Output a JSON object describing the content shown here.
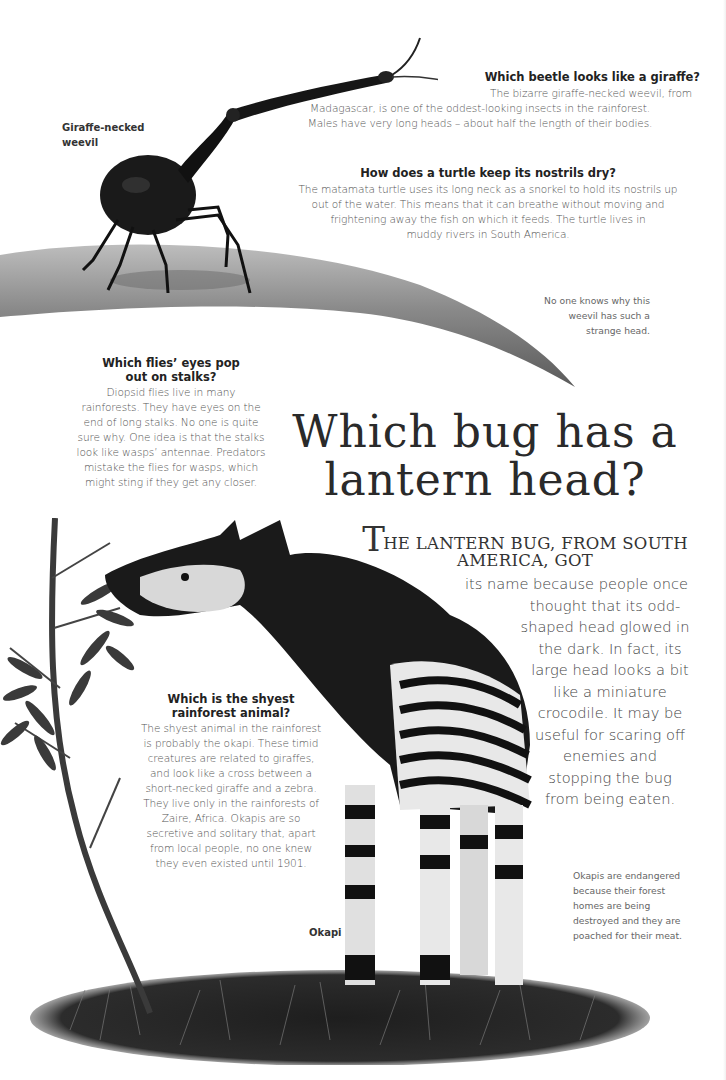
{
  "weevil_section": {
    "label": [
      "Giraffe-necked",
      "weevil"
    ],
    "question": "Which beetle looks like a giraffe?",
    "body_lines": [
      "The bizarre giraffe-necked weevil, from",
      "Madagascar, is one of the oddest-looking insects in the rainforest.",
      "Males have very long heads – about half the length of their bodies."
    ],
    "caption_lines": [
      "No one knows why this",
      "weevil has such a",
      "strange head."
    ]
  },
  "turtle_section": {
    "question": "How does a turtle keep its nostrils dry?",
    "body_lines": [
      "The matamata turtle uses its long neck as a snorkel to hold its nostrils up",
      "out of the water. This means that it can breathe without moving and",
      "frightening away the fish on which it feeds. The turtle lives in",
      "muddy rivers in South America."
    ]
  },
  "flies_section": {
    "question_lines": [
      "Which flies’ eyes pop",
      "out on stalks?"
    ],
    "body_lines": [
      "Diopsid flies live in many",
      "rainforests. They have eyes on the",
      "end of long stalks. No one is quite",
      "sure why. One idea is that the stalks",
      "look like wasps’ antennae. Predators",
      "mistake the flies for wasps, which",
      "might sting if they get any closer."
    ]
  },
  "main_feature": {
    "title_lines": [
      "Which bug has a",
      "lantern head?"
    ],
    "lead_dropcap": "T",
    "lead_lines": [
      "HE LANTERN BUG, FROM SOUTH",
      "AMERICA, GOT"
    ],
    "body_lines": [
      "its name because people once",
      "thought that its odd-",
      "shaped head glowed in",
      "the dark. In fact, its",
      "large head looks a bit",
      "like a miniature",
      "crocodile. It may be",
      "useful for scaring off",
      "enemies and",
      "stopping the bug",
      "from being eaten."
    ]
  },
  "okapi_section": {
    "question_lines": [
      "Which is the shyest",
      "rainforest animal?"
    ],
    "body_lines": [
      "The shyest animal in the rainforest",
      "is probably the okapi. These timid",
      "creatures are related to giraffes,",
      "and look like a cross between a",
      "short-necked giraffe and a zebra.",
      "They live only in the rainforests of",
      "Zaire, Africa. Okapis are so",
      "secretive and solitary that, apart",
      "from local people, no one knew",
      "they even existed until 1901."
    ],
    "label": "Okapi",
    "caption_lines": [
      "Okapis are endangered",
      "because their forest",
      "homes are being",
      "destroyed and they are",
      "poached for their meat."
    ]
  },
  "illustrations": {
    "weevil": "giraffe-necked-weevil-on-leaf",
    "okapi": "okapi-eating-leaves-on-grass",
    "tree": "sapling-tree"
  }
}
